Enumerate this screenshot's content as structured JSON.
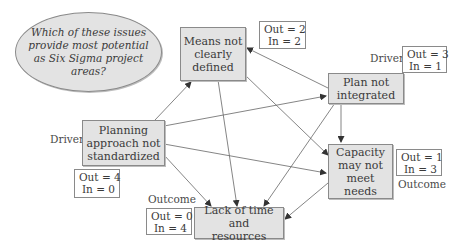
{
  "question": {
    "text": "Which of these issues\nprovide most potential\nas Six Sigma project areas?"
  },
  "nodes": [
    {
      "id": "means",
      "label": "Means not\nclearly\ndefined",
      "out": 2,
      "in": 2,
      "role": ""
    },
    {
      "id": "plan",
      "label": "Plan not\nintegrated",
      "out": 3,
      "in": 1,
      "role": "Driver"
    },
    {
      "id": "planning",
      "label": "Planning\napproach not\nstandardized",
      "out": 4,
      "in": 0,
      "role": "Driver"
    },
    {
      "id": "capacity",
      "label": "Capacity\nmay not\nmeet needs",
      "out": 1,
      "in": 3,
      "role": "Outcome"
    },
    {
      "id": "lack",
      "label": "Lack of time and\nresources",
      "out": 0,
      "in": 4,
      "role": "Outcome"
    }
  ],
  "stats": {
    "means": {
      "out": "Out = 2",
      "in": "In = 2"
    },
    "plan": {
      "out": "Out = 3",
      "in": "In = 1"
    },
    "planning": {
      "out": "Out = 4",
      "in": "In = 0"
    },
    "capacity": {
      "out": "Out = 1",
      "in": "In = 3"
    },
    "lack": {
      "out": "Out = 0",
      "in": "In = 4"
    }
  },
  "labels": {
    "plan_role": "Driver",
    "planning_role": "Driver",
    "capacity_role": "Outcome",
    "lack_role": "Outcome"
  },
  "edges": [
    {
      "from": "planning",
      "to": "means"
    },
    {
      "from": "planning",
      "to": "plan"
    },
    {
      "from": "planning",
      "to": "capacity"
    },
    {
      "from": "planning",
      "to": "lack"
    },
    {
      "from": "plan",
      "to": "means"
    },
    {
      "from": "plan",
      "to": "capacity"
    },
    {
      "from": "plan",
      "to": "lack"
    },
    {
      "from": "means",
      "to": "capacity"
    },
    {
      "from": "means",
      "to": "lack"
    },
    {
      "from": "capacity",
      "to": "lack"
    }
  ],
  "colors": {
    "node_fill": "#e3e3e3",
    "border": "#8a8a8a",
    "arrow": "#555555",
    "text": "#3a3a3a"
  }
}
